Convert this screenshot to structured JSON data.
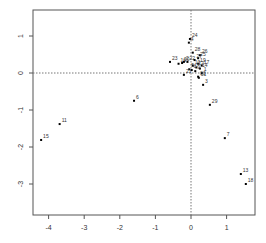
{
  "chart_data": {
    "type": "scatter",
    "title": "",
    "xlabel": "",
    "ylabel": "",
    "xlim": [
      -4.4,
      1.8
    ],
    "ylim": [
      -3.8,
      1.7
    ],
    "grid": false,
    "reference_lines": {
      "x": 0,
      "y": 0,
      "style": "dotted"
    },
    "x_ticks": [
      -4,
      -3,
      -2,
      -1,
      0,
      1
    ],
    "y_ticks": [
      -3,
      -2,
      -1,
      0,
      1
    ],
    "points": [
      {
        "label": "24",
        "x": -0.03,
        "y": 0.92
      },
      {
        "label": "4",
        "x": -0.06,
        "y": 0.82
      },
      {
        "label": "28",
        "x": 0.05,
        "y": 0.55
      },
      {
        "label": "26",
        "x": 0.25,
        "y": 0.48
      },
      {
        "label": "25",
        "x": 0.2,
        "y": 0.4
      },
      {
        "label": "23",
        "x": -0.59,
        "y": 0.3
      },
      {
        "label": "16",
        "x": -0.35,
        "y": 0.25
      },
      {
        "label": "20",
        "x": -0.25,
        "y": 0.27
      },
      {
        "label": "2",
        "x": -0.2,
        "y": 0.3
      },
      {
        "label": "22",
        "x": -0.1,
        "y": 0.3
      },
      {
        "label": "27",
        "x": 0.1,
        "y": 0.35
      },
      {
        "label": "19",
        "x": 0.2,
        "y": 0.25
      },
      {
        "label": "17",
        "x": 0.3,
        "y": 0.2
      },
      {
        "label": "14",
        "x": 0.25,
        "y": 0.12
      },
      {
        "label": "12",
        "x": 0.15,
        "y": 0.15
      },
      {
        "label": "10",
        "x": 0.05,
        "y": 0.2
      },
      {
        "label": "9",
        "x": 0.12,
        "y": 0.05
      },
      {
        "label": "8",
        "x": 0.02,
        "y": 0.08
      },
      {
        "label": "5",
        "x": -0.05,
        "y": 0.1
      },
      {
        "label": "1",
        "x": 0.3,
        "y": 0.0
      },
      {
        "label": "21",
        "x": -0.2,
        "y": -0.05
      },
      {
        "label": "30",
        "x": 0.2,
        "y": -0.1
      },
      {
        "label": "31",
        "x": 0.22,
        "y": -0.13
      },
      {
        "label": "3",
        "x": 0.34,
        "y": -0.32
      },
      {
        "label": "29",
        "x": 0.53,
        "y": -0.86
      },
      {
        "label": "6",
        "x": -1.6,
        "y": -0.75
      },
      {
        "label": "11",
        "x": -3.69,
        "y": -1.38
      },
      {
        "label": "15",
        "x": -4.21,
        "y": -1.81
      },
      {
        "label": "7",
        "x": 0.95,
        "y": -1.76
      },
      {
        "label": "13",
        "x": 1.4,
        "y": -2.73
      },
      {
        "label": "18",
        "x": 1.54,
        "y": -3.0
      }
    ]
  },
  "layout": {
    "plot_left": 33,
    "plot_top": 10,
    "plot_right": 255,
    "plot_bottom": 215,
    "x_zero_px": 191,
    "x_unit_px": 35.6,
    "y_zero_px": 73,
    "y_unit_px": 37
  },
  "colors": {
    "point": "#000000",
    "axis": "#555555",
    "label": "#333333",
    "refline": "#777777"
  }
}
